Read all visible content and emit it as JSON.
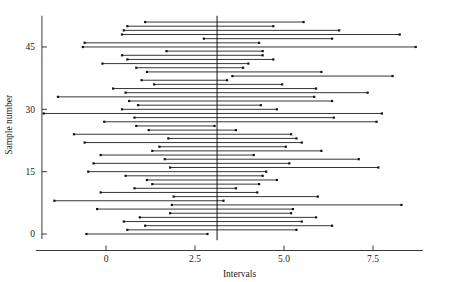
{
  "chart_data": {
    "type": "line",
    "title": "",
    "subtitle": "",
    "xlabel": "Intervals",
    "ylabel": "Sample number",
    "xlim": [
      -1.8,
      8.9
    ],
    "ylim": [
      -1.5,
      52.5
    ],
    "xticks": [
      0,
      2.5,
      5,
      7.5
    ],
    "xticklabels": [
      "0",
      "2.5",
      "5.0",
      "7.5"
    ],
    "yticks": [
      0,
      15,
      30,
      45
    ],
    "yticklabels": [
      "0",
      "15",
      "30",
      "45"
    ],
    "grid": false,
    "legend": null,
    "annotations": [
      {
        "name": "reference-line",
        "type": "vertical-line",
        "x": 3.12,
        "label": ""
      }
    ],
    "series": [
      {
        "name": "Confidence intervals",
        "marker": "square-endpoints",
        "orientation": "horizontal",
        "x_field": "lower/upper",
        "y_field": "sample",
        "intervals": [
          {
            "sample": 0,
            "lower": -0.55,
            "upper": 2.85
          },
          {
            "sample": 1,
            "lower": 0.6,
            "upper": 5.35
          },
          {
            "sample": 2,
            "lower": 1.1,
            "upper": 6.35
          },
          {
            "sample": 3,
            "lower": 0.5,
            "upper": 5.5
          },
          {
            "sample": 4,
            "lower": 0.95,
            "upper": 5.9
          },
          {
            "sample": 5,
            "lower": 1.8,
            "upper": 5.2
          },
          {
            "sample": 6,
            "lower": -0.25,
            "upper": 5.25
          },
          {
            "sample": 7,
            "lower": 1.85,
            "upper": 8.3
          },
          {
            "sample": 8,
            "lower": -1.45,
            "upper": 3.3
          },
          {
            "sample": 9,
            "lower": 1.9,
            "upper": 5.95
          },
          {
            "sample": 10,
            "lower": -0.15,
            "upper": 4.25
          },
          {
            "sample": 11,
            "lower": 0.8,
            "upper": 3.65
          },
          {
            "sample": 12,
            "lower": 1.3,
            "upper": 4.3
          },
          {
            "sample": 13,
            "lower": 1.15,
            "upper": 4.8
          },
          {
            "sample": 14,
            "lower": 0.55,
            "upper": 4.4
          },
          {
            "sample": 15,
            "lower": -0.5,
            "upper": 4.5
          },
          {
            "sample": 16,
            "lower": 1.8,
            "upper": 7.65
          },
          {
            "sample": 17,
            "lower": -0.35,
            "upper": 5.15
          },
          {
            "sample": 18,
            "lower": 1.65,
            "upper": 7.1
          },
          {
            "sample": 19,
            "lower": -0.15,
            "upper": 4.15
          },
          {
            "sample": 20,
            "lower": 1.3,
            "upper": 6.05
          },
          {
            "sample": 21,
            "lower": 1.5,
            "upper": 5.05
          },
          {
            "sample": 22,
            "lower": -0.6,
            "upper": 5.5
          },
          {
            "sample": 23,
            "lower": 1.75,
            "upper": 5.35
          },
          {
            "sample": 24,
            "lower": -0.9,
            "upper": 5.2
          },
          {
            "sample": 25,
            "lower": 1.2,
            "upper": 3.65
          },
          {
            "sample": 26,
            "lower": 0.85,
            "upper": 3.05
          },
          {
            "sample": 27,
            "lower": -0.05,
            "upper": 7.6
          },
          {
            "sample": 28,
            "lower": 0.8,
            "upper": 6.4
          },
          {
            "sample": 29,
            "lower": -1.75,
            "upper": 7.75
          },
          {
            "sample": 30,
            "lower": 0.45,
            "upper": 4.8
          },
          {
            "sample": 31,
            "lower": 0.9,
            "upper": 4.35
          },
          {
            "sample": 32,
            "lower": 0.65,
            "upper": 6.35
          },
          {
            "sample": 33,
            "lower": -1.35,
            "upper": 5.85
          },
          {
            "sample": 34,
            "lower": 0.55,
            "upper": 7.35
          },
          {
            "sample": 35,
            "lower": 0.2,
            "upper": 5.9
          },
          {
            "sample": 36,
            "lower": 1.35,
            "upper": 4.95
          },
          {
            "sample": 37,
            "lower": 1.0,
            "upper": 3.4
          },
          {
            "sample": 38,
            "lower": 3.55,
            "upper": 8.05
          },
          {
            "sample": 39,
            "lower": 1.15,
            "upper": 6.05
          },
          {
            "sample": 40,
            "lower": 0.85,
            "upper": 3.85
          },
          {
            "sample": 41,
            "lower": -0.1,
            "upper": 4.0
          },
          {
            "sample": 42,
            "lower": 0.6,
            "upper": 4.7
          },
          {
            "sample": 43,
            "lower": 0.45,
            "upper": 4.4
          },
          {
            "sample": 44,
            "lower": 1.7,
            "upper": 4.4
          },
          {
            "sample": 45,
            "lower": -0.65,
            "upper": 8.7
          },
          {
            "sample": 46,
            "lower": -0.6,
            "upper": 4.3
          },
          {
            "sample": 47,
            "lower": 2.75,
            "upper": 6.35
          },
          {
            "sample": 48,
            "lower": 0.45,
            "upper": 8.25
          },
          {
            "sample": 49,
            "lower": 0.5,
            "upper": 6.55
          },
          {
            "sample": 50,
            "lower": 0.6,
            "upper": 4.7
          },
          {
            "sample": 51,
            "lower": 1.1,
            "upper": 5.55
          }
        ]
      }
    ]
  },
  "axes": {
    "x_title": "Intervals",
    "y_title": "Sample number"
  },
  "colors": {
    "line": "#111111",
    "axis": "#222222",
    "background": "#ffffff"
  }
}
